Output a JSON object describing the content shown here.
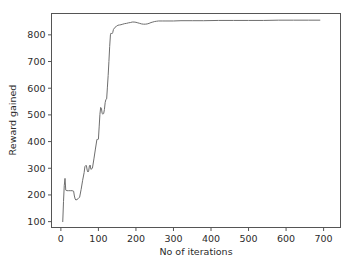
{
  "chart_data": {
    "type": "line",
    "title": "",
    "xlabel": "No of iterations",
    "ylabel": "Reward gained",
    "xlim": [
      -25,
      745
    ],
    "ylim": [
      78,
      880
    ],
    "xticks": [
      0,
      100,
      200,
      300,
      400,
      500,
      600,
      700
    ],
    "xticklabels": [
      "0",
      "100",
      "200",
      "300",
      "400",
      "500",
      "600",
      "700"
    ],
    "yticks": [
      100,
      200,
      300,
      400,
      500,
      600,
      700,
      800
    ],
    "yticklabels": [
      "100",
      "200",
      "300",
      "400",
      "500",
      "600",
      "700",
      "800"
    ],
    "grid": false,
    "legend": null,
    "line_color": "#6e6e6e",
    "series": [
      {
        "name": "reward",
        "x": [
          5,
          7,
          9,
          11,
          13,
          16,
          20,
          25,
          30,
          34,
          36,
          38,
          40,
          43,
          46,
          50,
          54,
          58,
          62,
          64,
          66,
          68,
          70,
          72,
          74,
          76,
          78,
          80,
          84,
          88,
          92,
          96,
          98,
          100,
          102,
          104,
          106,
          108,
          110,
          112,
          114,
          116,
          118,
          120,
          122,
          124,
          126,
          128,
          130,
          132,
          134,
          136,
          138,
          140,
          144,
          148,
          152,
          156,
          160,
          165,
          170,
          175,
          180,
          185,
          190,
          195,
          200,
          205,
          210,
          215,
          220,
          225,
          230,
          235,
          240,
          245,
          250,
          255,
          260,
          270,
          280,
          300,
          320,
          350,
          380,
          420,
          460,
          500,
          540,
          580,
          620,
          660,
          690
        ],
        "y": [
          100,
          175,
          235,
          262,
          218,
          216,
          216,
          216,
          216,
          214,
          196,
          185,
          181,
          183,
          186,
          192,
          221,
          255,
          284,
          306,
          310,
          310,
          293,
          286,
          290,
          309,
          312,
          296,
          300,
          335,
          372,
          408,
          408,
          409,
          455,
          502,
          528,
          525,
          505,
          503,
          505,
          520,
          546,
          558,
          560,
          604,
          648,
          700,
          756,
          800,
          807,
          804,
          808,
          820,
          828,
          832,
          836,
          837,
          838,
          840,
          842,
          843,
          845,
          846,
          848,
          848,
          847,
          845,
          843,
          841,
          840,
          840,
          841,
          843,
          846,
          848,
          850,
          851,
          852,
          852,
          852,
          852,
          853,
          853,
          853,
          854,
          854,
          854,
          854,
          855,
          855,
          855,
          855
        ]
      }
    ]
  },
  "axes": {
    "xlabel": "No of iterations",
    "ylabel": "Reward gained"
  }
}
